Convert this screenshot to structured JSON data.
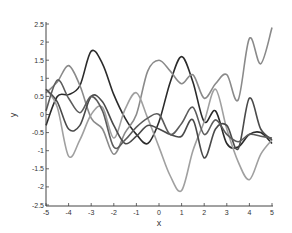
{
  "chart_data": {
    "type": "line",
    "title": "",
    "xlabel": "x",
    "ylabel": "y",
    "xlim": [
      -5,
      5
    ],
    "ylim": [
      -2.5,
      2.5
    ],
    "grid": false,
    "legend": null,
    "x_ticks": [
      -5,
      -4,
      -3,
      -2,
      -1,
      0,
      1,
      2,
      3,
      4,
      5
    ],
    "x_tick_labels": [
      "-5",
      "-4",
      "-3",
      "-2",
      "-1",
      "0",
      "1",
      "2",
      "3",
      "4",
      "5"
    ],
    "y_ticks": [
      2.5,
      2,
      1.5,
      1,
      0.5,
      0,
      -0.5,
      -1,
      -1.5,
      -2,
      -2.5
    ],
    "y_tick_labels": [
      "2.5",
      "2",
      "1.5",
      "1",
      "0.5",
      "0",
      "-0.5",
      "-1",
      "-1.5",
      "-2",
      "-2.5"
    ],
    "x": [
      -5,
      -4.5,
      -4,
      -3.5,
      -3,
      -2.5,
      -2,
      -1.5,
      -1,
      -0.5,
      0,
      0.5,
      1,
      1.5,
      2,
      2.5,
      3,
      3.5,
      4,
      4.5,
      5
    ],
    "series": [
      {
        "name": "sample 1",
        "color": "#2b2b2b",
        "values": [
          -0.3,
          0.5,
          0.55,
          0.8,
          1.75,
          1.4,
          0.55,
          -0.1,
          -0.55,
          -0.8,
          -0.2,
          0.9,
          1.6,
          0.9,
          -0.2,
          0.1,
          -0.8,
          -0.9,
          -0.55,
          -0.5,
          -0.8
        ]
      },
      {
        "name": "sample 2",
        "color": "#8a8a8a",
        "values": [
          0.6,
          0.9,
          1.35,
          0.8,
          -0.1,
          -0.4,
          -1.1,
          -0.5,
          0.0,
          1.2,
          1.5,
          1.2,
          0.85,
          1.1,
          0.45,
          0.85,
          1.1,
          0.4,
          2.1,
          1.4,
          2.4
        ]
      },
      {
        "name": "sample 3",
        "color": "#a0a0a0",
        "values": [
          0.7,
          0.2,
          -1.15,
          -0.7,
          0.0,
          0.2,
          -0.65,
          0.15,
          0.6,
          -0.1,
          -0.9,
          -1.7,
          -2.1,
          -1.0,
          -0.2,
          0.7,
          -0.4,
          -1.3,
          -1.8,
          -1.1,
          -0.7
        ]
      },
      {
        "name": "sample 4",
        "color": "#4a4a4a",
        "values": [
          0.7,
          0.35,
          -0.4,
          -0.3,
          0.5,
          0.35,
          -0.3,
          -0.8,
          -0.6,
          -0.3,
          -0.4,
          -0.55,
          -0.6,
          -0.15,
          -1.2,
          -0.4,
          -0.3,
          -0.95,
          0.45,
          -0.4,
          -0.7
        ]
      },
      {
        "name": "sample 5",
        "color": "#5c5c5c",
        "values": [
          0.1,
          0.95,
          0.45,
          0.05,
          0.5,
          0.1,
          -0.9,
          -0.7,
          -0.35,
          -0.1,
          0.0,
          -0.55,
          -0.25,
          0.2,
          -0.55,
          -0.15,
          -0.55,
          -0.75,
          -0.55,
          -0.6,
          -0.65
        ]
      }
    ]
  }
}
